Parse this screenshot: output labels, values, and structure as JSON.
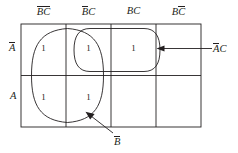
{
  "figure": {
    "type": "karnaugh-map",
    "variables": [
      "A",
      "B",
      "C"
    ],
    "grid": {
      "columns": 4,
      "rows": 2
    },
    "colors": {
      "line": "#231f20",
      "grouping": "#231f20",
      "background": "#ffffff"
    }
  },
  "column_headers": [
    {
      "id": "col-0",
      "text": "BC",
      "overbars": [
        "B",
        "C"
      ],
      "display": "B̄C̄"
    },
    {
      "id": "col-1",
      "text": "BC",
      "overbars": [
        "B"
      ],
      "display": "B̄C"
    },
    {
      "id": "col-2",
      "text": "BC",
      "overbars": [],
      "display": "BC"
    },
    {
      "id": "col-3",
      "text": "BC",
      "overbars": [
        "C"
      ],
      "display": "BC̄"
    }
  ],
  "row_labels": [
    {
      "id": "row-0",
      "text": "A",
      "overbar": true,
      "display": "Ā"
    },
    {
      "id": "row-1",
      "text": "A",
      "overbar": false,
      "display": "A"
    }
  ],
  "cells": {
    "row_0": [
      "1",
      "1",
      "1",
      ""
    ],
    "row_1": [
      "1",
      "1",
      "",
      ""
    ]
  },
  "groupings": [
    {
      "id": "group-b-not",
      "label": "B",
      "overbar": true,
      "display": "B̄",
      "covers": "columns 1-2, both rows"
    },
    {
      "id": "group-a-not-c",
      "label": "AC",
      "overbar_on": "A",
      "display": "ĀC",
      "covers": "columns 2-3, top row"
    }
  ],
  "annotations": {
    "right": {
      "display": "ĀC",
      "base": "AC"
    },
    "bottom": {
      "display": "B̄",
      "base": "B"
    }
  }
}
